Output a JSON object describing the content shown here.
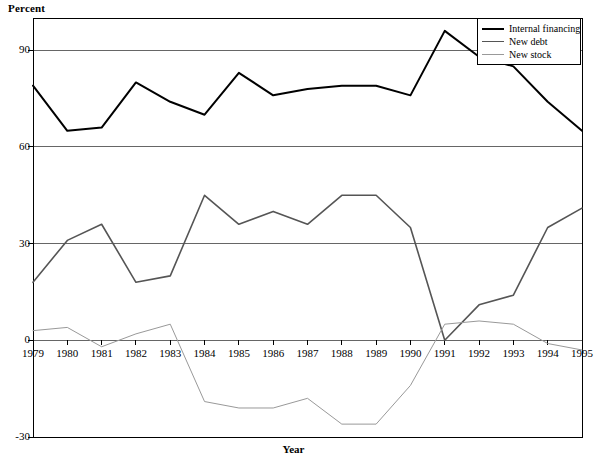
{
  "chart_data": {
    "type": "line",
    "title": "",
    "xlabel": "Year",
    "ylabel": "Percent",
    "grid": true,
    "legend_position": "top-right",
    "xlim": [
      1979,
      1995
    ],
    "ylim": [
      -30,
      100
    ],
    "y_ticks": [
      -30,
      0,
      30,
      60,
      90
    ],
    "categories": [
      1979,
      1980,
      1981,
      1982,
      1983,
      1984,
      1985,
      1986,
      1987,
      1988,
      1989,
      1990,
      1991,
      1992,
      1993,
      1994,
      1995
    ],
    "x_tick_labels": [
      "1979",
      "1980",
      "1981",
      "1982",
      "1983",
      "1984",
      "1985",
      "1986",
      "1987",
      "1988",
      "1989",
      "1990",
      "1991",
      "1992",
      "1993",
      "1994",
      "1995"
    ],
    "y_tick_labels": [
      "90",
      "60",
      "30",
      "0",
      "-30"
    ],
    "series": [
      {
        "name": "Internal financing",
        "color": "#000000",
        "width": 2.0,
        "values": [
          79,
          65,
          66,
          80,
          74,
          70,
          83,
          76,
          78,
          79,
          79,
          76,
          96,
          88,
          85,
          74,
          65
        ]
      },
      {
        "name": "New debt",
        "color": "#555555",
        "width": 1.6,
        "values": [
          18,
          31,
          36,
          18,
          20,
          45,
          36,
          40,
          36,
          45,
          45,
          35,
          0,
          11,
          14,
          35,
          41
        ]
      },
      {
        "name": "New stock",
        "color": "#999999",
        "width": 1.0,
        "values": [
          3,
          4,
          -2,
          2,
          5,
          -19,
          -21,
          -21,
          -18,
          -26,
          -26,
          -14,
          5,
          6,
          5,
          -1,
          -3
        ]
      }
    ]
  },
  "axes": {
    "y_title": "Percent",
    "x_title": "Year"
  },
  "legend": {
    "items": [
      {
        "label": "Internal financing"
      },
      {
        "label": "New debt"
      },
      {
        "label": "New stock"
      }
    ]
  },
  "colors": {
    "internal_financing": "#000000",
    "new_debt": "#555555",
    "new_stock": "#999999",
    "axis": "#000000",
    "grid": "#666666",
    "background": "#ffffff"
  }
}
